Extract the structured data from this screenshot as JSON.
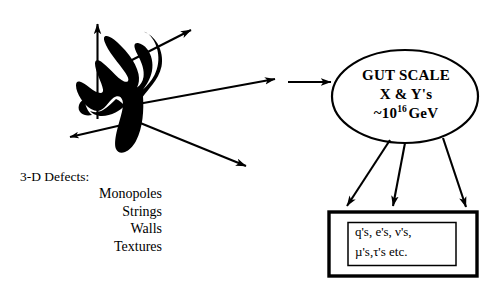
{
  "diagram": {
    "title_text": "GUT scale symmetry breaking and topological defects diagram",
    "background_color": "#ffffff",
    "ink_color": "#000000",
    "blot": {
      "name": "ink-blot-defect-region"
    },
    "defects": {
      "heading": "3-D Defects:",
      "items": [
        "Monopoles",
        "Strings",
        "Walls",
        "Textures"
      ]
    },
    "gut_node": {
      "line1": "GUT SCALE",
      "line2": "X & Y's",
      "line3_prefix": "~10",
      "line3_exponent": "16",
      "line3_suffix": "GeV"
    },
    "particle_box": {
      "line1": "q's, e's, ν's,",
      "line2": "µ's,τ's etc."
    },
    "arrows": [
      {
        "name": "arrow-up",
        "label": ""
      },
      {
        "name": "arrow-up-right",
        "label": ""
      },
      {
        "name": "arrow-right-long",
        "label": ""
      },
      {
        "name": "arrow-down-left",
        "label": ""
      },
      {
        "name": "arrow-down-right",
        "label": ""
      },
      {
        "name": "arrow-to-gut-ellipse",
        "label": ""
      },
      {
        "name": "arrow-gut-to-box-left",
        "label": ""
      },
      {
        "name": "arrow-gut-to-box-middle",
        "label": ""
      },
      {
        "name": "arrow-gut-to-box-right",
        "label": ""
      }
    ]
  }
}
